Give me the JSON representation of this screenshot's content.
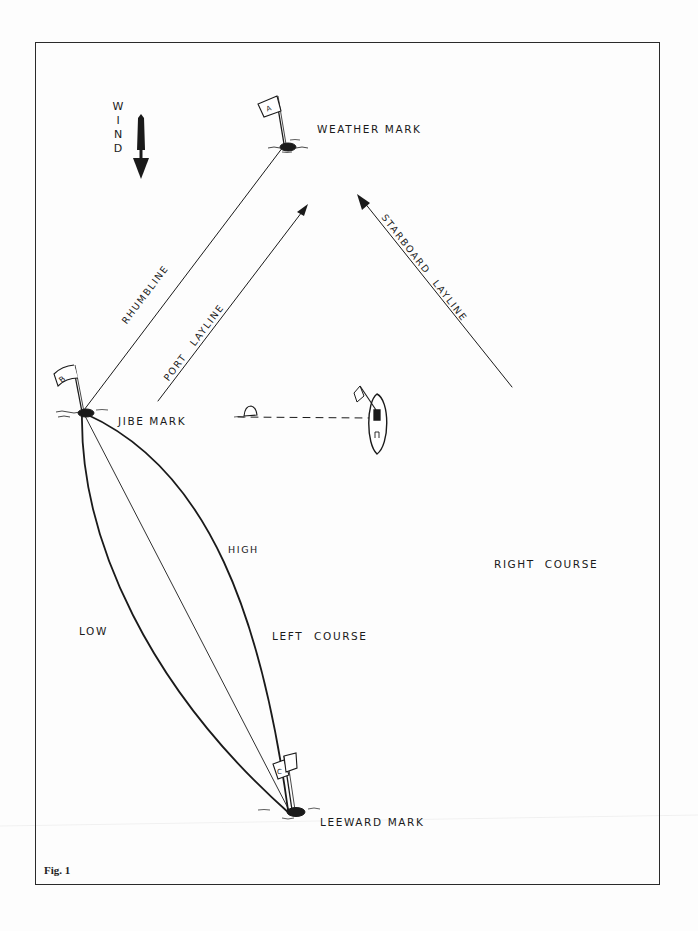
{
  "figure": {
    "caption": "Fig. 1",
    "wind": {
      "label_letters": [
        "W",
        "I",
        "N",
        "D"
      ],
      "direction": "down",
      "icon": "wind-arrow-icon"
    },
    "marks": {
      "weather": {
        "flag_letter": "A",
        "label": "WEATHER MARK"
      },
      "jibe": {
        "flag_letter": "B",
        "label": "JIBE MARK"
      },
      "leeward": {
        "flag_letter": "C",
        "label": "LEEWARD MARK"
      }
    },
    "lines": {
      "rhumbline": "RHUMBLINE",
      "port_layline": "PORT LAYLINE",
      "starboard_layline": "STARBOARD LAYLINE"
    },
    "courses": {
      "high": "HIGH",
      "low": "LOW",
      "left_course": "LEFT COURSE",
      "right_course": "RIGHT COURSE"
    },
    "colors": {
      "ink": "#1a1a1a",
      "paper": "#fdfdfd",
      "frame": "#2a2a2a"
    }
  }
}
